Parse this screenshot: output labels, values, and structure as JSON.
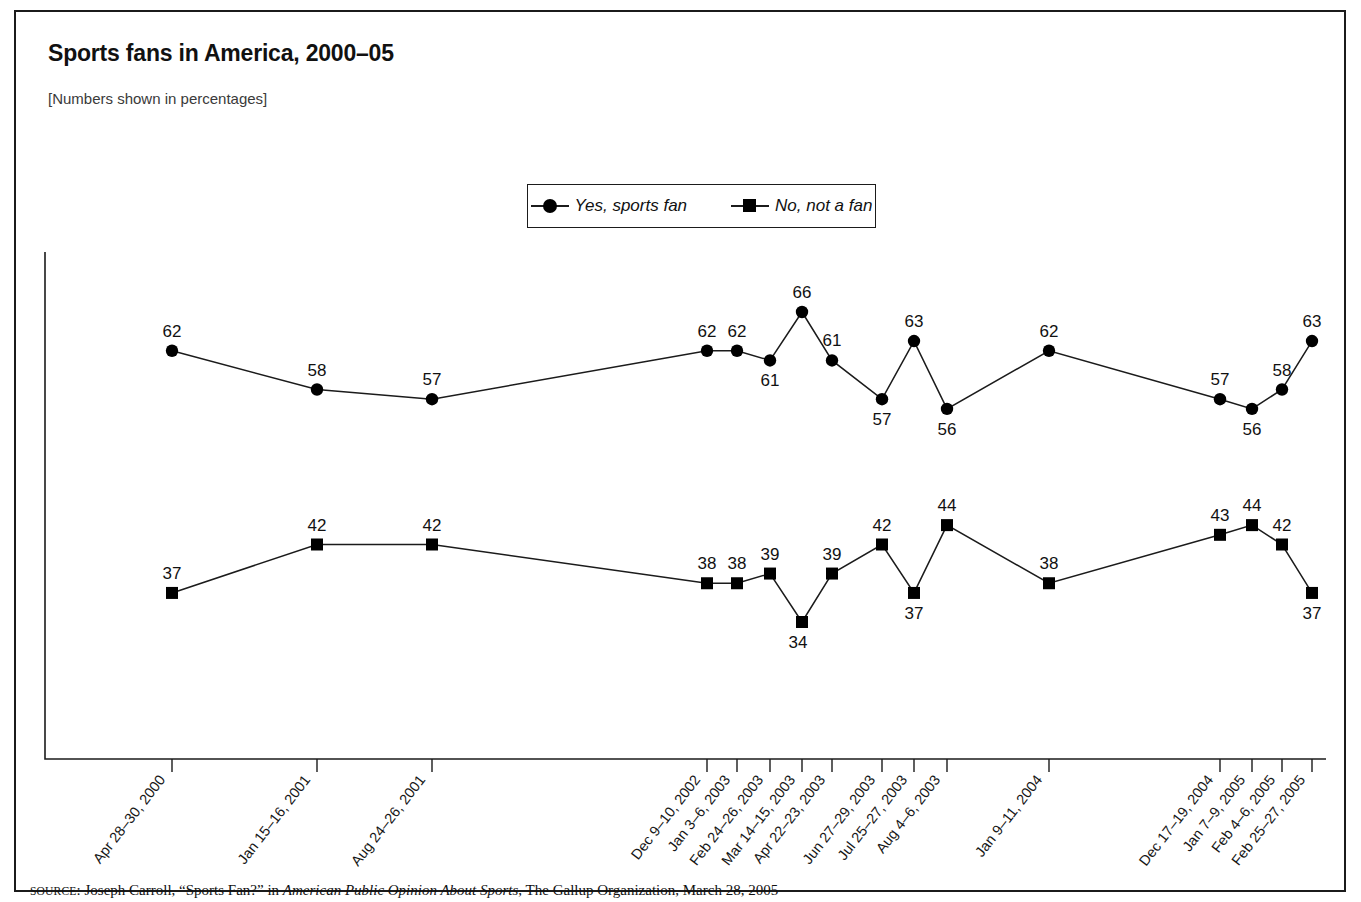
{
  "figure": {
    "title": "Sports fans in America, 2000–05",
    "subtitle": "[Numbers shown in percentages]",
    "source_prefix": "SOURCE",
    "source_text": ": Joseph Carroll, “Sports Fan?” in ",
    "source_italic": "American Public Opinion About Sports",
    "source_tail": ", The Gallup Organization, March 28, 2005"
  },
  "legend": {
    "position": "top-center",
    "entries": [
      {
        "label": "Yes, sports fan",
        "marker": "circle-marker-icon",
        "color": "#000000"
      },
      {
        "label": "No, not a fan",
        "marker": "square-marker-icon",
        "color": "#000000"
      }
    ]
  },
  "chart_data": {
    "type": "line",
    "title": "Sports fans in America, 2000–05",
    "subtitle": "[Numbers shown in percentages]",
    "xlabel": "",
    "ylabel": "",
    "ylim": [
      0,
      100
    ],
    "grid": false,
    "legend_position": "top-center",
    "categories": [
      "Apr 28–30, 2000",
      "Jan 15–16, 2001",
      "Aug 24–26, 2001",
      "Dec 9–10, 2002",
      "Jan 3–6, 2003",
      "Feb 24–26, 2003",
      "Mar 14–15, 2003",
      "Apr 22–23, 2003",
      "Jun 27–29, 2003",
      "Jul 25–27, 2003",
      "Aug 4–6, 2003",
      "Jan 9–11, 2004",
      "Dec 17–19, 2004",
      "Jan 7–9, 2005",
      "Feb 4–6, 2005",
      "Feb 25–27, 2005"
    ],
    "series": [
      {
        "name": "Yes, sports fan",
        "marker": "circle",
        "values": [
          62,
          58,
          57,
          62,
          62,
          61,
          66,
          61,
          57,
          63,
          56,
          62,
          57,
          56,
          58,
          63
        ]
      },
      {
        "name": "No, not a fan",
        "marker": "square",
        "values": [
          37,
          42,
          42,
          38,
          38,
          39,
          34,
          39,
          42,
          37,
          44,
          38,
          43,
          44,
          42,
          37
        ]
      }
    ]
  }
}
